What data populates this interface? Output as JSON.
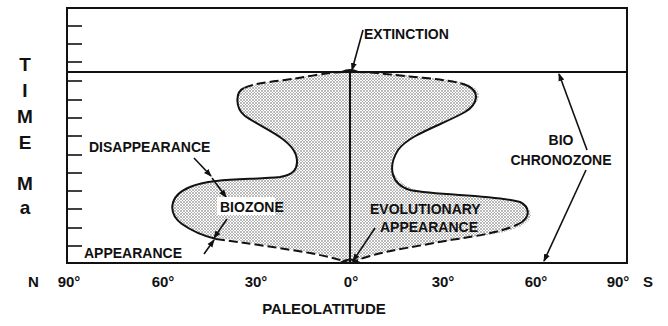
{
  "diagram": {
    "y_axis": {
      "label_letters": [
        "T",
        "I",
        "M",
        "E",
        "M",
        "a"
      ],
      "label": "TIME Ma",
      "tick_count": 14
    },
    "x_axis": {
      "label": "PALEOLATITUDE",
      "north_marker": "N",
      "south_marker": "S",
      "ticks": [
        "90°",
        "60°",
        "30°",
        "0°",
        "30°",
        "60°",
        "90°"
      ]
    },
    "annotations": {
      "extinction": "EXTINCTION",
      "disappearance": "DISAPPEARANCE",
      "biozone": "BIOZONE",
      "appearance": "APPEARANCE",
      "evolutionary_line1": "EVOLUTIONARY",
      "evolutionary_line2": "APPEARANCE",
      "bio": "BIO",
      "chronozone": "CHRONOZONE"
    },
    "colors": {
      "ink": "#111111",
      "background": "#ffffff",
      "stipple": "#555555"
    }
  }
}
